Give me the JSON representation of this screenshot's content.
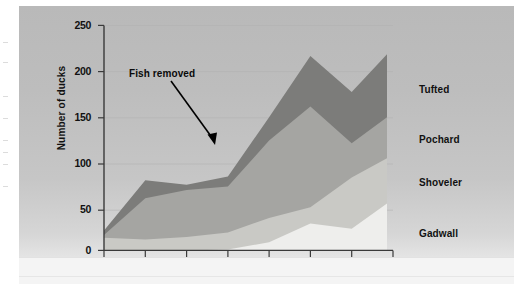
{
  "chart_data": {
    "type": "area",
    "stacked": true,
    "title": "",
    "subtitle": "",
    "xlabel": "",
    "ylabel": "Number of ducks",
    "categories": [
      "1984",
      "1985",
      "1986",
      "1987",
      "1988",
      "1989",
      "1990",
      "1991"
    ],
    "x": [
      1984,
      1985,
      1986,
      1987,
      1988,
      1989,
      1990,
      1991
    ],
    "xlim": [
      1984,
      1991
    ],
    "ylim": [
      0,
      250
    ],
    "yticks": [
      0,
      50,
      100,
      150,
      200,
      250
    ],
    "ytick_labels": [
      "0",
      "50",
      "100",
      "150",
      "200",
      "250"
    ],
    "grid": true,
    "legend_position": "right-inline",
    "series": [
      {
        "name": "Gadwall",
        "color": "#eeeeec",
        "values": [
          0,
          0,
          0,
          1,
          9,
          30,
          24,
          57
        ],
        "stack_order": 1
      },
      {
        "name": "Shoveler",
        "color": "#c9c9c5",
        "values": [
          14,
          12,
          15,
          19,
          27,
          18,
          57,
          49
        ],
        "stack_order": 2
      },
      {
        "name": "Pochard",
        "color": "#a5a5a2",
        "values": [
          3,
          46,
          52,
          51,
          86,
          112,
          38,
          47
        ],
        "stack_order": 3
      },
      {
        "name": "Tufted",
        "color": "#7c7c7a",
        "values": [
          5,
          20,
          6,
          11,
          26,
          56,
          57,
          72
        ],
        "stack_order": 4
      }
    ],
    "series_totals": [
      22,
      78,
      73,
      82,
      148,
      216,
      176,
      225
    ],
    "annotations": [
      {
        "text": "Fish removed",
        "x": 1985.6,
        "y": 198,
        "arrow_to_x": 1986.5,
        "arrow_to_y": 100
      }
    ]
  },
  "axis": {
    "y_title": "Number of ducks",
    "y_ticks": [
      "250",
      "200",
      "150",
      "100",
      "50",
      "0"
    ],
    "x_ticks": [
      "1984",
      "1985",
      "1986",
      "1987",
      "1988",
      "1989",
      "1990",
      "1991"
    ]
  },
  "legend": {
    "items": [
      {
        "label": "Tufted"
      },
      {
        "label": "Pochard"
      },
      {
        "label": "Shoveler"
      },
      {
        "label": "Gadwall"
      }
    ]
  },
  "annotation": {
    "label": "Fish removed"
  },
  "colors": {
    "tufted": "#7c7c7a",
    "pochard": "#a5a5a2",
    "shoveler": "#c9c9c5",
    "gadwall": "#eeeeec",
    "axis": "#3a3a3a",
    "text": "#111111",
    "grid": "#b4b4b4"
  }
}
